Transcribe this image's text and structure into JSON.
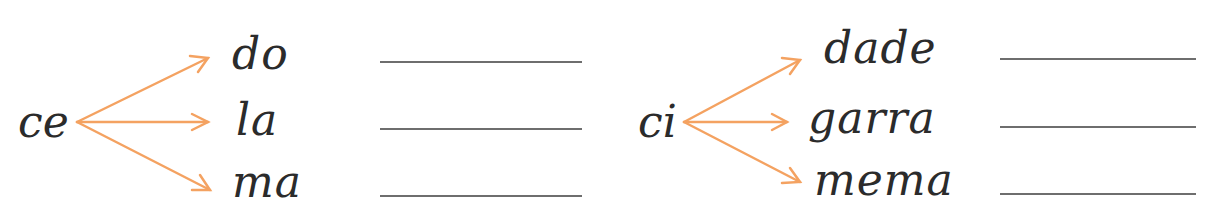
{
  "colors": {
    "arrow": "#F4A261",
    "text": "#2b2b2b",
    "line": "#6e6e6e"
  },
  "groups": [
    {
      "stem": "ce",
      "syllables": [
        "do",
        "la",
        "ma"
      ],
      "answers": [
        "",
        "",
        ""
      ]
    },
    {
      "stem": "ci",
      "syllables": [
        "dade",
        "garra",
        "mema"
      ],
      "answers": [
        "",
        "",
        ""
      ]
    }
  ]
}
